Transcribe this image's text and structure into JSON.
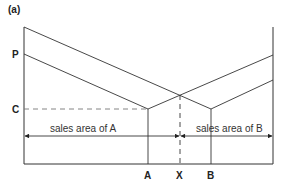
{
  "figure": {
    "panel_label": "(a)",
    "y_labels": {
      "p": "P",
      "c": "C"
    },
    "x_labels": {
      "a": "A",
      "x": "X",
      "b": "B"
    },
    "area_labels": {
      "a": "sales area of A",
      "b": "sales area of B"
    },
    "colors": {
      "line": "#333333",
      "dashed": "#555555",
      "background": "#ffffff"
    }
  }
}
